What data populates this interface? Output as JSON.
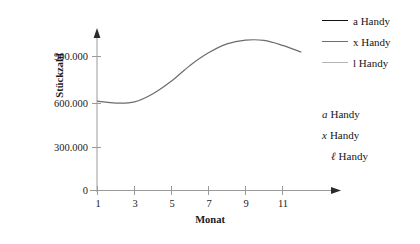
{
  "chart_data": {
    "type": "line",
    "title": "",
    "subtitle": "",
    "xlabel": "Monat",
    "ylabel": "Stückzahl",
    "xlim": [
      1,
      12.6
    ],
    "ylim": [
      0,
      1080000
    ],
    "grid": false,
    "legend_position": "right",
    "x_ticks": [
      "1",
      "3",
      "5",
      "7",
      "9",
      "11"
    ],
    "x_tick_values": [
      1,
      3,
      5,
      7,
      9,
      11
    ],
    "y_ticks": [
      "0",
      "300.000",
      "600.000",
      "900.000"
    ],
    "y_tick_values": [
      0,
      300000,
      600000,
      900000
    ],
    "x": [
      1,
      2,
      3,
      4,
      5,
      6,
      7,
      8,
      9,
      10,
      11,
      12
    ],
    "series": [
      {
        "name": "a Handy",
        "color": "#6b6b6b",
        "values": [
          600000,
          587000,
          595000,
          650000,
          735000,
          840000,
          925000,
          985000,
          1010000,
          1008000,
          975000,
          930000
        ]
      }
    ],
    "annotations": []
  },
  "axes": {
    "y_title": "Stückzahl",
    "x_title": "Monat",
    "y_tick_labels": [
      "900.000",
      "600.000",
      "300.000",
      "0"
    ],
    "x_tick_labels": [
      "1",
      "3",
      "5",
      "7",
      "9",
      "11"
    ]
  },
  "legend_swatches": {
    "items": [
      {
        "label": "a Handy",
        "color": "#101010",
        "thickness": "1.8px"
      },
      {
        "label": "x Handy",
        "color": "#6e6e6e",
        "thickness": "1.2px"
      },
      {
        "label": "l Handy",
        "color": "#b4b4b4",
        "thickness": "1.2px"
      }
    ]
  },
  "legend_plain": {
    "items": [
      {
        "symbol": "a",
        "label": "Handy"
      },
      {
        "symbol": "x",
        "label": "Handy"
      },
      {
        "symbol": "ℓ",
        "label": "Handy"
      }
    ]
  },
  "colors": {
    "axis": "#9a9a9a",
    "curve": "#6b6b6b",
    "text": "#1a1a1a",
    "background": "#ffffff"
  }
}
